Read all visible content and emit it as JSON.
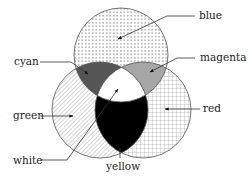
{
  "diagram": {
    "type": "venn-additive-color",
    "circles": [
      {
        "name": "blue",
        "cx": 121,
        "cy": 55,
        "r": 47,
        "pattern": "dots"
      },
      {
        "name": "green",
        "cx": 100,
        "cy": 110,
        "r": 48,
        "pattern": "diagonal-hatch"
      },
      {
        "name": "red",
        "cx": 143,
        "cy": 110,
        "r": 48,
        "pattern": "grid"
      }
    ],
    "regions": {
      "cyan": {
        "fill": "#555555",
        "between": [
          "blue",
          "green"
        ]
      },
      "magenta": {
        "fill": "#a6a6a6",
        "between": [
          "blue",
          "red"
        ]
      },
      "yellow": {
        "fill": "#000000",
        "between": [
          "green",
          "red"
        ]
      },
      "white": {
        "fill": "#ffffff",
        "between": [
          "blue",
          "green",
          "red"
        ]
      }
    },
    "labels": {
      "blue": "blue",
      "cyan": "cyan",
      "magenta": "magenta",
      "green": "green",
      "red": "red",
      "white": "white",
      "yellow": "yellow"
    }
  }
}
